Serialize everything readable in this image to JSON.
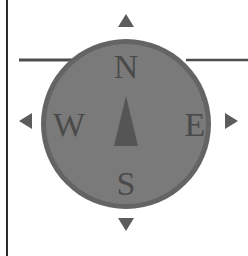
{
  "compass": {
    "labels": {
      "north": "N",
      "east": "E",
      "south": "S",
      "west": "W"
    },
    "colors": {
      "dial_fill": "#7a7a7a",
      "dial_ring": "#646464",
      "needle": "#555555",
      "letters": "#4a4a4a",
      "arrows": "#5c5c5c",
      "lines": "#4d4d4d",
      "frame": "#2b2b2b"
    },
    "arrows": [
      "arrow-up",
      "arrow-right",
      "arrow-down",
      "arrow-left"
    ]
  }
}
